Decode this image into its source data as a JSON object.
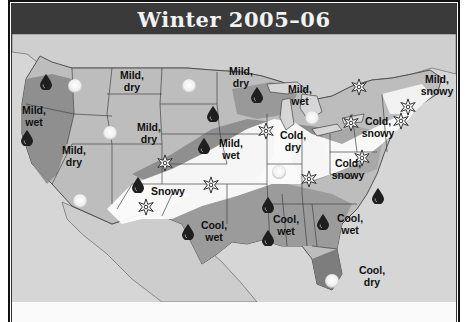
{
  "title": "Winter 2005–06",
  "legend_icons": {
    "sun": "sun-icon",
    "rain": "raindrop-icon",
    "snow": "snowflake-icon"
  },
  "colors": {
    "title_bg": "#3a3a3a",
    "mild_fill": "#9a9a9a",
    "wet_dark": "#7a7a7a",
    "snowy_fill": "#ffffff",
    "base_land": "#c9c9c9",
    "ocean": "#d9d9d9"
  },
  "regions": [
    {
      "id": "pacific-nw",
      "label": [
        "Mild,",
        "wet"
      ]
    },
    {
      "id": "northern-rockies",
      "label": [
        "Mild,",
        "dry"
      ]
    },
    {
      "id": "upper-midwest",
      "label": [
        "Mild,",
        "dry"
      ]
    },
    {
      "id": "central-plains",
      "label": [
        "Mild,",
        "dry"
      ]
    },
    {
      "id": "great-basin",
      "label": [
        "Mild,",
        "dry"
      ]
    },
    {
      "id": "great-lakes",
      "label": [
        "Mild,",
        "wet"
      ]
    },
    {
      "id": "midwest",
      "label": [
        "Mild,",
        "wet"
      ]
    },
    {
      "id": "ohio-valley",
      "label": [
        "Cold,",
        "dry"
      ]
    },
    {
      "id": "new-england",
      "label": [
        "Mild,",
        "snowy"
      ]
    },
    {
      "id": "northeast",
      "label": [
        "Cold,",
        "snowy"
      ]
    },
    {
      "id": "mid-atlantic",
      "label": [
        "Cold,",
        "snowy"
      ]
    },
    {
      "id": "southwest",
      "label": [
        "Snowy"
      ]
    },
    {
      "id": "texas",
      "label": [
        "Cool,",
        "wet"
      ]
    },
    {
      "id": "gulf-states",
      "label": [
        "Cool,",
        "wet"
      ]
    },
    {
      "id": "southeast",
      "label": [
        "Cool,",
        "wet"
      ]
    },
    {
      "id": "florida",
      "label": [
        "Cool,",
        "dry"
      ]
    }
  ]
}
